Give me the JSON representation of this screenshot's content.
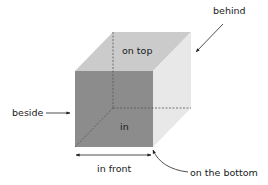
{
  "diagram": {
    "type": "prepositions-of-place cube",
    "labels": {
      "behind": "behind",
      "on_top": "on top",
      "beside": "beside",
      "in": "in",
      "in_front": "in front",
      "on_the_bottom": "on the bottom"
    },
    "colors": {
      "front_face": "#8c8c8c",
      "top_face": "#cbcbcb",
      "right_face": "#e8e8e8",
      "hidden_edges": "#555555",
      "arrows": "#222222",
      "text": "#1a1a1a",
      "background": "#ffffff"
    }
  }
}
